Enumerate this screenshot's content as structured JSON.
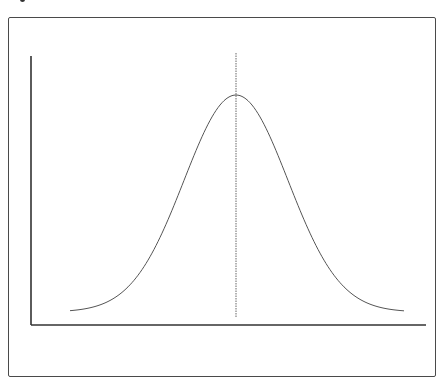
{
  "figure": {
    "title": "",
    "caption": ""
  },
  "diagram": {
    "type": "normal-distribution-curve",
    "axes": {
      "x_label": "",
      "y_label": "",
      "ticks": []
    },
    "curve": {
      "shape": "gaussian",
      "mean_marker": "dotted-vertical-line",
      "color": "#555555"
    },
    "axis_color": "#333333",
    "frame_color": "#4a4a4a"
  }
}
